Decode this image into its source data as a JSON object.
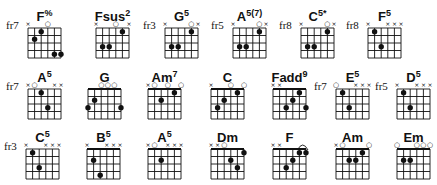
{
  "grid": {
    "strings": 6,
    "frets": 4,
    "string_spacing": 6.6,
    "fret_spacing": 7.5
  },
  "colors": {
    "ink": "#111111",
    "background": "#ffffff"
  },
  "chords": [
    {
      "name": "F%",
      "base": "F",
      "sup": "%",
      "fret_label": "fr7",
      "x": 28,
      "y": 28,
      "nut": false,
      "markers": [
        "x",
        "",
        "",
        "o",
        "",
        ""
      ],
      "dots": [
        [
          1,
          2
        ],
        [
          2,
          1
        ],
        [
          4,
          4
        ],
        [
          5,
          4
        ]
      ],
      "barre": null
    },
    {
      "name": "Fsus2",
      "base": "Fsus",
      "sup": "2",
      "fret_label": "",
      "x": 96,
      "y": 28,
      "nut": false,
      "markers": [
        "x",
        "",
        "",
        "o",
        "",
        "x"
      ],
      "dots": [
        [
          1,
          3
        ],
        [
          2,
          3
        ],
        [
          4,
          1
        ]
      ],
      "barre": null
    },
    {
      "name": "G5",
      "base": "G",
      "sup": "5",
      "fret_label": "fr3",
      "x": 165,
      "y": 28,
      "nut": false,
      "markers": [
        "x",
        "",
        "",
        "",
        "o",
        "x"
      ],
      "dots": [
        [
          1,
          3
        ],
        [
          2,
          3
        ],
        [
          4,
          1
        ]
      ],
      "barre": null
    },
    {
      "name": "A5(7)",
      "base": "A",
      "sup": "5(7)",
      "fret_label": "fr5",
      "x": 233,
      "y": 28,
      "nut": false,
      "markers": [
        "x",
        "",
        "",
        "",
        "o",
        "x"
      ],
      "dots": [
        [
          1,
          3
        ],
        [
          2,
          3
        ],
        [
          4,
          1
        ]
      ],
      "barre": null
    },
    {
      "name": "C5*",
      "base": "C",
      "sup": "5*",
      "fret_label": "fr8",
      "x": 301,
      "y": 28,
      "nut": false,
      "markers": [
        "x",
        "",
        "",
        "",
        "o",
        "x"
      ],
      "dots": [
        [
          1,
          3
        ],
        [
          2,
          3
        ],
        [
          4,
          1
        ]
      ],
      "barre": null
    },
    {
      "name": "F5",
      "base": "F",
      "sup": "5",
      "fret_label": "fr8",
      "x": 368,
      "y": 28,
      "nut": false,
      "markers": [
        "x",
        "",
        "",
        "x",
        "x",
        "x"
      ],
      "dots": [
        [
          1,
          1
        ],
        [
          2,
          3
        ]
      ],
      "barre": null
    },
    {
      "name": "A5",
      "base": "A",
      "sup": "5",
      "fret_label": "fr7",
      "x": 28,
      "y": 89,
      "nut": false,
      "markers": [
        "x",
        "o",
        "",
        "",
        "x",
        "x"
      ],
      "dots": [
        [
          2,
          1
        ],
        [
          3,
          3
        ]
      ],
      "barre": null
    },
    {
      "name": "G",
      "base": "G",
      "sup": "",
      "fret_label": "",
      "x": 88,
      "y": 89,
      "nut": true,
      "markers": [
        "",
        "",
        "o",
        "o",
        "o",
        ""
      ],
      "dots": [
        [
          0,
          3
        ],
        [
          1,
          2
        ],
        [
          5,
          3
        ]
      ],
      "barre": null
    },
    {
      "name": "Am7",
      "base": "Am",
      "sup": "7",
      "fret_label": "",
      "x": 148,
      "y": 89,
      "nut": true,
      "markers": [
        "x",
        "o",
        "",
        "o",
        "",
        "o"
      ],
      "dots": [
        [
          2,
          2
        ],
        [
          4,
          1
        ]
      ],
      "barre": null
    },
    {
      "name": "C",
      "base": "C",
      "sup": "",
      "fret_label": "",
      "x": 211,
      "y": 89,
      "nut": true,
      "markers": [
        "x",
        "",
        "",
        "o",
        "",
        "o"
      ],
      "dots": [
        [
          1,
          3
        ],
        [
          2,
          2
        ],
        [
          4,
          1
        ]
      ],
      "barre": null
    },
    {
      "name": "Fadd9",
      "base": "Fadd",
      "sup": "9",
      "fret_label": "",
      "x": 273,
      "y": 89,
      "nut": true,
      "markers": [
        "x",
        "x",
        "",
        "",
        "",
        ""
      ],
      "dots": [
        [
          2,
          3
        ],
        [
          3,
          2
        ],
        [
          4,
          1
        ],
        [
          5,
          3
        ]
      ],
      "barre": null
    },
    {
      "name": "E5",
      "base": "E",
      "sup": "5",
      "fret_label": "fr7",
      "x": 336,
      "y": 89,
      "nut": false,
      "markers": [
        "o",
        "",
        "",
        "x",
        "x",
        "x"
      ],
      "dots": [
        [
          1,
          1
        ],
        [
          2,
          3
        ]
      ],
      "barre": null
    },
    {
      "name": "D5",
      "base": "D",
      "sup": "5",
      "fret_label": "fr5",
      "x": 397,
      "y": 89,
      "nut": false,
      "markers": [
        "x",
        "",
        "",
        "x",
        "x",
        "x"
      ],
      "dots": [
        [
          1,
          1
        ],
        [
          2,
          3
        ]
      ],
      "barre": null
    },
    {
      "name": "C5",
      "base": "C",
      "sup": "5",
      "fret_label": "fr3",
      "x": 26,
      "y": 149,
      "nut": false,
      "markers": [
        "x",
        "",
        "",
        "x",
        "x",
        "x"
      ],
      "dots": [
        [
          1,
          1
        ],
        [
          2,
          3
        ]
      ],
      "barre": null
    },
    {
      "name": "B5",
      "base": "B",
      "sup": "5",
      "fret_label": "",
      "x": 87,
      "y": 149,
      "nut": true,
      "markers": [
        "x",
        "",
        "",
        "x",
        "x",
        "x"
      ],
      "dots": [
        [
          1,
          2
        ],
        [
          2,
          4
        ]
      ],
      "barre": null
    },
    {
      "name": "A5",
      "base": "A",
      "sup": "5",
      "fret_label": "",
      "x": 148,
      "y": 149,
      "nut": true,
      "markers": [
        "x",
        "o",
        "",
        "x",
        "x",
        "x"
      ],
      "dots": [
        [
          2,
          2
        ]
      ],
      "barre": null
    },
    {
      "name": "Dm",
      "base": "Dm",
      "sup": "",
      "fret_label": "",
      "x": 211,
      "y": 149,
      "nut": true,
      "markers": [
        "x",
        "x",
        "o",
        "",
        "",
        ""
      ],
      "dots": [
        [
          3,
          2
        ],
        [
          4,
          3
        ],
        [
          5,
          1
        ]
      ],
      "barre": null
    },
    {
      "name": "F",
      "base": "F",
      "sup": "",
      "fret_label": "",
      "x": 273,
      "y": 149,
      "nut": true,
      "markers": [
        "x",
        "x",
        "",
        "",
        "",
        ""
      ],
      "dots": [
        [
          2,
          3
        ],
        [
          3,
          2
        ],
        [
          4,
          1
        ],
        [
          5,
          1
        ]
      ],
      "barre": [
        4,
        5
      ]
    },
    {
      "name": "Am",
      "base": "Am",
      "sup": "",
      "fret_label": "",
      "x": 336,
      "y": 149,
      "nut": true,
      "markers": [
        "x",
        "o",
        "",
        "",
        "",
        "o"
      ],
      "dots": [
        [
          2,
          2
        ],
        [
          3,
          2
        ],
        [
          4,
          1
        ]
      ],
      "barre": null
    },
    {
      "name": "Em",
      "base": "Em",
      "sup": "",
      "fret_label": "",
      "x": 397,
      "y": 149,
      "nut": true,
      "markers": [
        "o",
        "",
        "",
        "o",
        "o",
        "o"
      ],
      "dots": [
        [
          1,
          2
        ],
        [
          2,
          2
        ]
      ],
      "barre": null
    }
  ]
}
